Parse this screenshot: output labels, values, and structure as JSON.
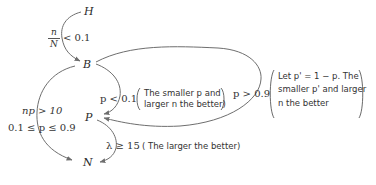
{
  "nodes": {
    "H": "H",
    "B": "B",
    "P": "P",
    "N": "N"
  },
  "edges": {
    "H_to_B": {
      "condition_num": "n",
      "condition_den": "N",
      "condition_rest": "< 0.1"
    },
    "B_to_P_small": {
      "condition": "p < 0.1",
      "note_line1": "The smaller p and",
      "note_line2": "larger n the better)"
    },
    "B_to_P_large": {
      "condition": "p > 0.9",
      "note_line1": "Let p' = 1 − p. The",
      "note_line2": "smaller p' and larger",
      "note_line3": "n the better"
    },
    "B_to_N": {
      "condition_line1": "np > 10",
      "condition_line2": "0.1 ≤ p ≤ 0.9"
    },
    "P_to_N": {
      "condition": "λ ≥ 15",
      "note": "( The larger the better)"
    }
  },
  "colors": {
    "stroke": "#6e6e6e",
    "text": "#2a2a2a"
  }
}
